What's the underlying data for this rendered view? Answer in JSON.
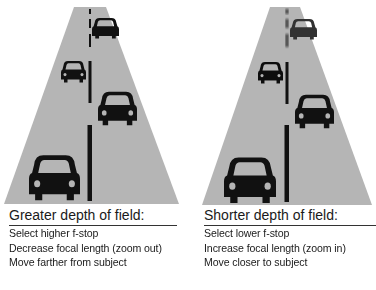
{
  "colors": {
    "road": "#b5b5b5",
    "markings": "#111111",
    "car": "#111111",
    "text": "#1a1a1a",
    "background": "#ffffff"
  },
  "panels": [
    {
      "id": "greater",
      "heading": "Greater depth of field:",
      "items": [
        "Select higher f-stop",
        "Decrease focal length (zoom out)",
        "Move farther from subject"
      ],
      "illustration": "road-with-cars-all-sharp"
    },
    {
      "id": "shorter",
      "heading": "Shorter depth of field:",
      "items": [
        "Select lower f-stop",
        "Increase focal length (zoom in)",
        "Move closer to subject"
      ],
      "illustration": "road-with-cars-distant-blurred"
    }
  ]
}
